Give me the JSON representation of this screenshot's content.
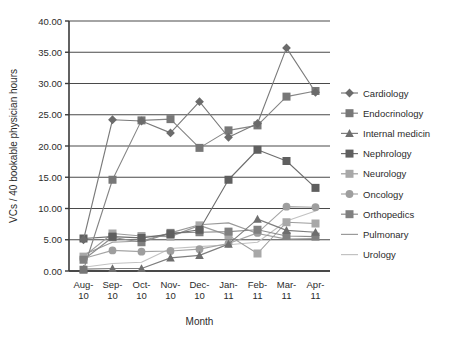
{
  "chart_data": {
    "type": "line",
    "title": "",
    "xlabel": "Month",
    "ylabel": "VCs / 40 bookable physician hours",
    "categories": [
      "Aug-10",
      "Sep-10",
      "Oct-10",
      "Nov-10",
      "Dec-10",
      "Jan-11",
      "Feb-11",
      "Mar-11",
      "Apr-11"
    ],
    "category_lines": [
      [
        "Aug-",
        "10"
      ],
      [
        "Sep-",
        "10"
      ],
      [
        "Oct-",
        "10"
      ],
      [
        "Nov-",
        "10"
      ],
      [
        "Dec-",
        "10"
      ],
      [
        "Jan-",
        "11"
      ],
      [
        "Feb-",
        "11"
      ],
      [
        "Mar-",
        "11"
      ],
      [
        "Apr-",
        "11"
      ]
    ],
    "ylim": [
      0,
      40
    ],
    "yticks": [
      "0.00",
      "5.00",
      "10.00",
      "15.00",
      "20.00",
      "25.00",
      "30.00",
      "35.00",
      "40.00"
    ],
    "ytick_values": [
      0,
      5,
      10,
      15,
      20,
      25,
      30,
      35,
      40
    ],
    "grid": "horizontal",
    "legend_position": "right",
    "series": [
      {
        "name": "Cardiology",
        "marker": "diamond",
        "color": "#6b6b6b",
        "line_color": "#7a7a7a",
        "values": [
          5.0,
          24.2,
          24.0,
          22.1,
          27.1,
          21.4,
          23.6,
          35.7,
          28.6
        ]
      },
      {
        "name": "Endocrinology",
        "marker": "square",
        "color": "#777777",
        "line_color": "#858585",
        "values": [
          0.2,
          14.6,
          24.1,
          24.3,
          19.7,
          22.5,
          23.3,
          27.9,
          28.8
        ]
      },
      {
        "name": "Internal medicin",
        "marker": "triangle",
        "color": "#6e6e6e",
        "line_color": "#7d7d7d",
        "values": [
          0.3,
          0.4,
          0.4,
          2.1,
          2.5,
          4.3,
          8.3,
          6.5,
          6.2
        ]
      },
      {
        "name": "Nephrology",
        "marker": "square",
        "color": "#5f5f5f",
        "line_color": "#6d6d6d",
        "values": [
          5.2,
          5.5,
          5.3,
          5.9,
          6.6,
          14.6,
          19.4,
          17.6,
          13.3
        ]
      },
      {
        "name": "Neurology",
        "marker": "square",
        "color": "#a8a8a8",
        "line_color": "#9c9c9c",
        "values": [
          2.3,
          6.0,
          5.6,
          5.5,
          7.3,
          5.7,
          2.8,
          7.8,
          7.6
        ]
      },
      {
        "name": "Oncology",
        "marker": "circle",
        "color": "#9e9e9e",
        "line_color": "#a5a5a5",
        "values": [
          2.0,
          3.3,
          3.1,
          3.2,
          3.5,
          4.4,
          6.1,
          10.3,
          10.2
        ]
      },
      {
        "name": "Orthopedics",
        "marker": "square",
        "color": "#808080",
        "line_color": "#8c8c8c",
        "values": [
          1.8,
          5.4,
          4.6,
          6.1,
          6.2,
          6.3,
          6.6,
          5.6,
          5.5
        ]
      },
      {
        "name": "Pulmonary",
        "marker": "none",
        "color": "#9a9a9a",
        "line_color": "#9a9a9a",
        "values": [
          2.6,
          4.6,
          4.8,
          6.1,
          7.4,
          7.7,
          6.0,
          5.1,
          5.2
        ]
      },
      {
        "name": "Urology",
        "marker": "none",
        "color": "#c2c2c2",
        "line_color": "#c2c2c2",
        "values": [
          0.6,
          1.2,
          1.4,
          3.6,
          3.9,
          4.2,
          4.6,
          8.0,
          9.6
        ]
      }
    ]
  },
  "axis": {
    "frame_color": "#3a3a3a",
    "grid_color": "#4a4a4a"
  }
}
